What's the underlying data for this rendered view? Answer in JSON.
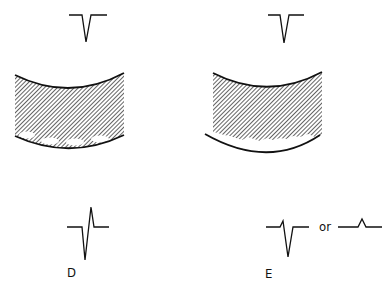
{
  "panels": [
    {
      "id": "D",
      "label": "D",
      "top_waveform": "negative-spike",
      "bottom_waveform": "biphasic-spike",
      "tissue": "hatched-band-with-bubbles"
    },
    {
      "id": "E",
      "label": "E",
      "top_waveform": "negative-spike",
      "bottom_waveform": "negative-spike-with-small-positive",
      "alt_waveform": "small-positive-bump",
      "connector": "or",
      "tissue": "hatched-band-irregular-bottom-with-gap"
    }
  ],
  "colors": {
    "ink": "#111111",
    "background": "#ffffff"
  }
}
